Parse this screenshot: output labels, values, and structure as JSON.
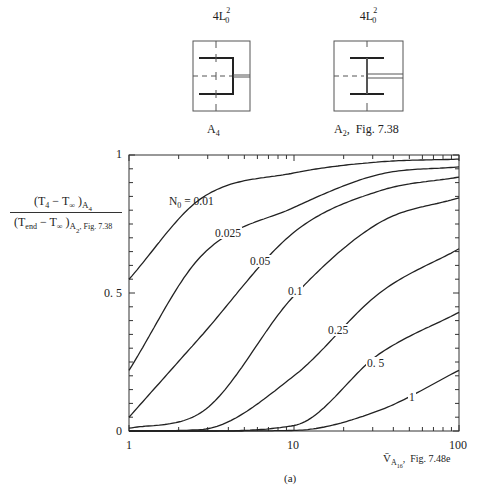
{
  "diagrams": [
    {
      "title_base": "4L",
      "title_sub": "0",
      "title_sup": "2",
      "caption_base": "A",
      "caption_sub": "4",
      "caption_suffix": ""
    },
    {
      "title_base": "4L",
      "title_sub": "0",
      "title_sup": "2",
      "caption_base": "A",
      "caption_sub": "2",
      "caption_suffix": ",  Fig. 7.38"
    }
  ],
  "ylabel": {
    "num_open": "(T",
    "num_sub1": "4",
    "num_mid": " − T",
    "num_sub2": "∞",
    "num_close": " )",
    "num_subscript": "A",
    "num_subscript_sub": "4",
    "den_open": "(T",
    "den_sub1": "end",
    "den_mid": " − T",
    "den_sub2": "∞",
    "den_close": " )",
    "den_subscript": "A",
    "den_subscript_sub": "2",
    "den_subscript_tail": ", Fig. 7.38"
  },
  "xlabel": {
    "base": "V̄",
    "sub": "A",
    "subsub": "16",
    "tail": ",  Fig. 7.48e"
  },
  "caption": "(a)",
  "y_ticks": [
    "1",
    "0. 5",
    "0"
  ],
  "x_ticks": [
    "1",
    "10",
    "100"
  ],
  "curve_labels": [
    {
      "prefix": "N",
      "prefix_sub": "0",
      "text": " = 0.01"
    },
    {
      "text": "0.025"
    },
    {
      "text": "0.05"
    },
    {
      "text": "0.1"
    },
    {
      "text": "0.25"
    },
    {
      "text": "0. 5"
    },
    {
      "text": "1"
    }
  ],
  "chart_data": {
    "type": "line",
    "title": "",
    "xlabel": "V̄_A16, Fig. 7.48e",
    "ylabel": "(T4 − T∞)_A4 / (Tend − T∞)_A2, Fig. 7.38",
    "x_scale": "log",
    "xlim": [
      1,
      100
    ],
    "ylim": [
      0,
      1
    ],
    "x_ticks": [
      1,
      10,
      100
    ],
    "y_ticks": [
      0,
      0.5,
      1
    ],
    "grid": false,
    "legend": "inline curve labels",
    "x": [
      1,
      2.7,
      10,
      33,
      100
    ],
    "series": [
      {
        "name": "N0 = 0.01",
        "values": [
          0.55,
          0.84,
          0.935,
          0.975,
          0.985
        ]
      },
      {
        "name": "N0 = 0.025",
        "values": [
          0.22,
          0.63,
          0.81,
          0.93,
          0.957
        ]
      },
      {
        "name": "N0 = 0.05",
        "values": [
          0.05,
          0.34,
          0.72,
          0.87,
          0.92
        ]
      },
      {
        "name": "N0 = 0.1",
        "values": [
          0.01,
          0.065,
          0.49,
          0.755,
          0.845
        ]
      },
      {
        "name": "N0 = 0.25",
        "values": [
          0.0,
          0.005,
          0.2,
          0.5,
          0.66
        ]
      },
      {
        "name": "N0 = 0.5",
        "values": [
          0.0,
          0.0,
          0.02,
          0.28,
          0.43
        ]
      },
      {
        "name": "N0 = 1",
        "values": [
          0.0,
          0.0,
          0.002,
          0.075,
          0.22
        ]
      }
    ],
    "annotations": [
      "N0 = 0.01",
      "0.025",
      "0.05",
      "0.1",
      "0.25",
      "0. 5",
      "1",
      "(a)"
    ]
  }
}
